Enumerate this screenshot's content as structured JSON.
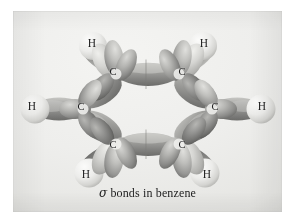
{
  "figure": {
    "kind": "photographic-plate",
    "caption": {
      "symbol": "σ",
      "text": " bonds in benzene",
      "full": "σ bonds in benzene"
    },
    "background_color": "#eeeeec",
    "page_color": "#ffffff",
    "plate": {
      "left": 13,
      "top": 11,
      "width": 269,
      "height": 201
    }
  },
  "palette": {
    "lobe_light": "#cfcfcc",
    "lobe_mid": "#a9a9a6",
    "lobe_dark": "#7d7d7b",
    "lobe_shadow": "#646462",
    "hydrogen_sphere": "#e9e9e6",
    "hydrogen_sphere_edge": "#b9b9b6",
    "bond_overlap": "#8e8e8c",
    "label_color": "#1a1a1a",
    "caption_color": "#212121"
  },
  "molecule": {
    "name": "benzene",
    "formula": "C6H6",
    "ring_center": {
      "x": 146,
      "y": 98
    },
    "carbon_count": 6,
    "hydrogen_count": 6,
    "carbons": [
      {
        "id": "C1",
        "label": "C",
        "label_x": 100,
        "label_y": 61,
        "x": 103,
        "y": 63,
        "position": "top-left"
      },
      {
        "id": "C2",
        "label": "C",
        "label_x": 169,
        "label_y": 61,
        "x": 166,
        "y": 63,
        "position": "top-right"
      },
      {
        "id": "C3",
        "label": "C",
        "label_x": 202,
        "label_y": 96,
        "x": 199,
        "y": 98,
        "position": "right"
      },
      {
        "id": "C4",
        "label": "C",
        "label_x": 169,
        "label_y": 134,
        "x": 166,
        "y": 133,
        "position": "bottom-right"
      },
      {
        "id": "C5",
        "label": "C",
        "label_x": 100,
        "label_y": 134,
        "x": 103,
        "y": 133,
        "position": "bottom-left"
      },
      {
        "id": "C6",
        "label": "C",
        "label_x": 68,
        "label_y": 96,
        "x": 70,
        "y": 98,
        "position": "left"
      }
    ],
    "hydrogens": [
      {
        "id": "H1",
        "label": "H",
        "label_x": 79,
        "label_y": 33,
        "x": 81,
        "y": 35,
        "position": "top-left",
        "bonded_to": "C1"
      },
      {
        "id": "H2",
        "label": "H",
        "label_x": 191,
        "label_y": 33,
        "x": 189,
        "y": 35,
        "position": "top-right",
        "bonded_to": "C2"
      },
      {
        "id": "H3",
        "label": "H",
        "label_x": 249,
        "label_y": 96,
        "x": 247,
        "y": 98,
        "position": "right",
        "bonded_to": "C3"
      },
      {
        "id": "H4",
        "label": "H",
        "label_x": 194,
        "label_y": 164,
        "x": 192,
        "y": 162,
        "position": "bottom-right",
        "bonded_to": "C4"
      },
      {
        "id": "H5",
        "label": "H",
        "label_x": 73,
        "label_y": 164,
        "x": 76,
        "y": 162,
        "position": "bottom-left",
        "bonded_to": "C5"
      },
      {
        "id": "H6",
        "label": "H",
        "label_x": 19,
        "label_y": 96,
        "x": 21,
        "y": 98,
        "position": "left",
        "bonded_to": "C6"
      }
    ],
    "cc_bonds": [
      {
        "from": "C1",
        "to": "C2",
        "type": "sigma",
        "orientation": "horizontal-top"
      },
      {
        "from": "C2",
        "to": "C3",
        "type": "sigma",
        "orientation": "diagonal"
      },
      {
        "from": "C3",
        "to": "C4",
        "type": "sigma",
        "orientation": "diagonal"
      },
      {
        "from": "C4",
        "to": "C5",
        "type": "sigma",
        "orientation": "horizontal-bottom"
      },
      {
        "from": "C5",
        "to": "C6",
        "type": "sigma",
        "orientation": "diagonal"
      },
      {
        "from": "C6",
        "to": "C1",
        "type": "sigma",
        "orientation": "diagonal"
      }
    ]
  }
}
